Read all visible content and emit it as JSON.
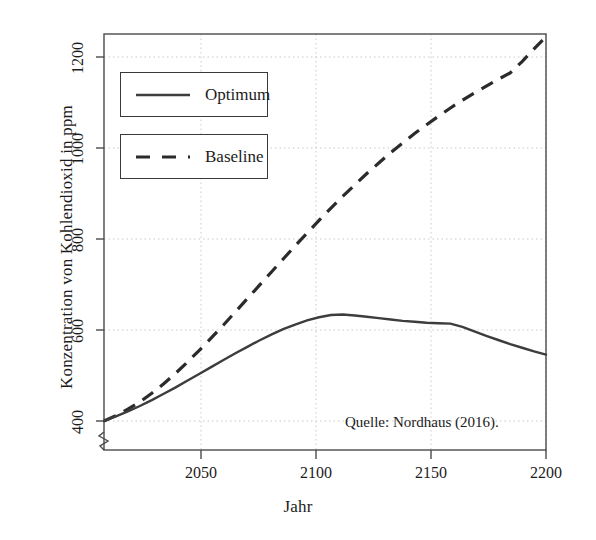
{
  "chart_data": {
    "type": "line",
    "title": "",
    "xlabel": "Jahr",
    "ylabel": "Konzentration von Kohlendioxid in ppm",
    "xlim": [
      2015,
      2200
    ],
    "ylim": [
      385,
      1275
    ],
    "xticks": [
      2050,
      2100,
      2150,
      2200
    ],
    "xtick_labels": [
      "2050",
      "2100",
      "2150",
      "2200"
    ],
    "yticks": [
      400,
      600,
      800,
      1000,
      1200
    ],
    "ytick_labels": [
      "400",
      "600",
      "800",
      "1000",
      "1200"
    ],
    "grid": true,
    "grid_style": "dotted",
    "y_axis_break": true,
    "legend_position": "upper-left",
    "annotation": "Quelle: Nordhaus (2016).",
    "series": [
      {
        "name": "Optimum",
        "style": "solid",
        "color": "#3d3d3d",
        "x": [
          2015,
          2020,
          2025,
          2030,
          2035,
          2040,
          2045,
          2050,
          2055,
          2060,
          2065,
          2070,
          2075,
          2080,
          2085,
          2090,
          2095,
          2100,
          2105,
          2110,
          2115,
          2120,
          2125,
          2130,
          2135,
          2140,
          2145,
          2150,
          2155,
          2160,
          2165,
          2170,
          2175,
          2180,
          2185,
          2190,
          2195,
          2200
        ],
        "values": [
          400,
          410,
          421,
          433,
          446,
          460,
          474,
          489,
          504,
          519,
          534,
          549,
          563,
          577,
          590,
          602,
          612,
          621,
          628,
          633,
          634,
          632,
          629,
          626,
          623,
          620,
          618,
          616,
          615,
          614,
          607,
          597,
          587,
          578,
          569,
          561,
          553,
          546
        ]
      },
      {
        "name": "Baseline",
        "style": "dashed",
        "color": "#2b2b2b",
        "x": [
          2015,
          2020,
          2025,
          2030,
          2035,
          2040,
          2045,
          2050,
          2055,
          2060,
          2065,
          2070,
          2075,
          2080,
          2085,
          2090,
          2095,
          2100,
          2105,
          2110,
          2115,
          2120,
          2125,
          2130,
          2135,
          2140,
          2145,
          2150,
          2155,
          2160,
          2165,
          2170,
          2175,
          2180,
          2185,
          2190,
          2195,
          2200
        ],
        "values": [
          400,
          412,
          426,
          442,
          461,
          482,
          505,
          530,
          556,
          583,
          611,
          640,
          669,
          698,
          727,
          756,
          785,
          813,
          841,
          868,
          894,
          919,
          944,
          967,
          990,
          1011,
          1032,
          1051,
          1070,
          1088,
          1105,
          1121,
          1136,
          1151,
          1165,
          1190,
          1218,
          1245
        ]
      }
    ]
  },
  "axes": {
    "ylabel": "Konzentration von Kohlendioxid in ppm",
    "xlabel": "Jahr"
  },
  "legend": {
    "items": [
      {
        "label": "Optimum",
        "style": "solid"
      },
      {
        "label": "Baseline",
        "style": "dashed"
      }
    ]
  },
  "annotation": {
    "source": "Quelle: Nordhaus (2016)."
  },
  "ticks": {
    "y": [
      "400",
      "600",
      "800",
      "1000",
      "1200"
    ],
    "x": [
      "2050",
      "2100",
      "2150",
      "2200"
    ]
  }
}
